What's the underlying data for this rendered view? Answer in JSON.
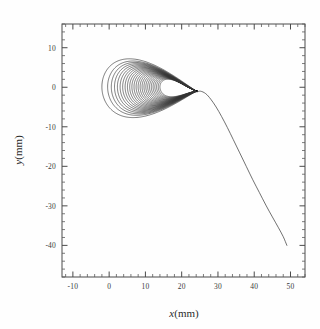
{
  "chart_data": {
    "type": "line",
    "title": "",
    "xlabel": "x(mm)",
    "ylabel": "y(mm)",
    "xlim": [
      -13,
      54
    ],
    "ylim": [
      -48,
      16
    ],
    "grid": false,
    "legend": null,
    "x_ticks": [
      -10,
      0,
      10,
      20,
      30,
      40,
      50
    ],
    "x_tick_labels": [
      "-10",
      "0",
      "10",
      "20",
      "30",
      "40",
      "50"
    ],
    "y_ticks": [
      10,
      0,
      -10,
      -20,
      -30,
      -40
    ],
    "y_tick_labels": [
      "10",
      "0",
      "-10",
      "-20",
      "-30",
      "-40"
    ],
    "x_minor_per_major": 5,
    "y_minor_per_major": 5,
    "axis_style": "box-with-inward-ticks-all-four-sides",
    "series": [
      {
        "name": "nested-loop-family",
        "kind": "closed-loops",
        "loop_count": 26,
        "left_vertex": [
          -2.0,
          0.0
        ],
        "cusp_vertex": [
          24.2,
          -1.0
        ],
        "outer_loop_extent": {
          "x": [
            -2.0,
            24.2
          ],
          "y": [
            -10.0,
            10.2
          ]
        },
        "inner_loop_extent": {
          "x": [
            14.0,
            24.2
          ],
          "y": [
            -3.2,
            3.4
          ]
        }
      },
      {
        "name": "escape-trajectory",
        "kind": "open-curve",
        "start": [
          24.8,
          -1.0
        ],
        "end": [
          49.0,
          -40.0
        ],
        "points_xy": [
          [
            24.2,
            -1.2
          ],
          [
            25.2,
            -1.0
          ],
          [
            26.6,
            -1.6
          ],
          [
            28.0,
            -3.0
          ],
          [
            29.5,
            -5.0
          ],
          [
            31.0,
            -7.4
          ],
          [
            32.6,
            -10.2
          ],
          [
            34.2,
            -13.2
          ],
          [
            36.0,
            -16.6
          ],
          [
            37.8,
            -20.0
          ],
          [
            39.6,
            -23.4
          ],
          [
            41.4,
            -26.6
          ],
          [
            43.2,
            -29.8
          ],
          [
            45.0,
            -32.8
          ],
          [
            46.6,
            -35.4
          ],
          [
            48.0,
            -37.8
          ],
          [
            49.0,
            -40.0
          ]
        ]
      }
    ],
    "colors": {
      "curve": "#333333",
      "axis": "#4a4a4a",
      "background": "#fefefe"
    }
  }
}
